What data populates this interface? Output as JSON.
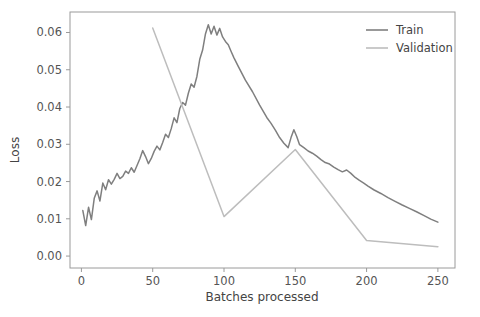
{
  "chart_data": {
    "type": "line",
    "title": "",
    "xlabel": "Batches processed",
    "ylabel": "Loss",
    "xlim": [
      -8,
      262
    ],
    "ylim": [
      -0.0032,
      0.0655
    ],
    "grid": false,
    "legend_position": "upper right",
    "xticks": [
      0,
      50,
      100,
      150,
      200,
      250
    ],
    "xtick_labels": [
      "0",
      "50",
      "100",
      "150",
      "200",
      "250"
    ],
    "yticks": [
      0.0,
      0.01,
      0.02,
      0.03,
      0.04,
      0.05,
      0.06
    ],
    "ytick_labels": [
      "0.00",
      "0.01",
      "0.02",
      "0.03",
      "0.04",
      "0.05",
      "0.06"
    ],
    "series": [
      {
        "name": "Train",
        "color": "#7f7f7f",
        "x": [
          1,
          3,
          5,
          7,
          9,
          11,
          13,
          15,
          17,
          19,
          21,
          23,
          25,
          27,
          29,
          31,
          33,
          35,
          37,
          39,
          41,
          43,
          45,
          47,
          49,
          51,
          53,
          55,
          57,
          59,
          61,
          63,
          65,
          67,
          69,
          71,
          73,
          75,
          77,
          79,
          81,
          83,
          85,
          87,
          89,
          91,
          93,
          95,
          97,
          99,
          101,
          103,
          105,
          107,
          110,
          115,
          120,
          125,
          130,
          133,
          136,
          139,
          142,
          145,
          147,
          149,
          151,
          153,
          156,
          159,
          162,
          165,
          168,
          171,
          174,
          177,
          180,
          183,
          186,
          189,
          192,
          195,
          198,
          201,
          205,
          210,
          215,
          220,
          225,
          230,
          235,
          240,
          245,
          250
        ],
        "y": [
          0.0122,
          0.0082,
          0.0131,
          0.0098,
          0.0155,
          0.0175,
          0.0148,
          0.0196,
          0.0178,
          0.0205,
          0.0193,
          0.0206,
          0.0222,
          0.0208,
          0.0214,
          0.0228,
          0.0222,
          0.0237,
          0.0225,
          0.0243,
          0.0261,
          0.0283,
          0.0267,
          0.0248,
          0.0262,
          0.0281,
          0.0295,
          0.0285,
          0.0305,
          0.0327,
          0.0318,
          0.0342,
          0.0371,
          0.0358,
          0.0396,
          0.0412,
          0.0405,
          0.0437,
          0.0462,
          0.0453,
          0.0482,
          0.0528,
          0.0553,
          0.0596,
          0.0621,
          0.0596,
          0.0617,
          0.0593,
          0.0611,
          0.0588,
          0.0576,
          0.0567,
          0.0549,
          0.0532,
          0.0509,
          0.0472,
          0.0441,
          0.0405,
          0.0372,
          0.0356,
          0.0338,
          0.0318,
          0.0303,
          0.0291,
          0.0318,
          0.0339,
          0.0321,
          0.0299,
          0.0291,
          0.0282,
          0.0276,
          0.0268,
          0.0259,
          0.0251,
          0.0247,
          0.0239,
          0.0232,
          0.0226,
          0.0231,
          0.0222,
          0.0211,
          0.0203,
          0.0196,
          0.0188,
          0.0178,
          0.0168,
          0.0157,
          0.0147,
          0.0137,
          0.0128,
          0.0119,
          0.0109,
          0.0099,
          0.0091
        ],
        "linewidth": 1.5
      },
      {
        "name": "Validation",
        "color": "#bdbdbd",
        "x": [
          50,
          100,
          150,
          200,
          250
        ],
        "y": [
          0.0612,
          0.0106,
          0.0286,
          0.0042,
          0.0025
        ],
        "linewidth": 1.5
      }
    ],
    "legend_entries": [
      {
        "label": "Train",
        "color": "#7f7f7f"
      },
      {
        "label": "Validation",
        "color": "#bdbdbd"
      }
    ]
  },
  "figure": {
    "background_color": "#ffffff",
    "axes_color": "#9a9a9a",
    "tick_label_color": "#555555",
    "axis_title_color": "#444444"
  }
}
